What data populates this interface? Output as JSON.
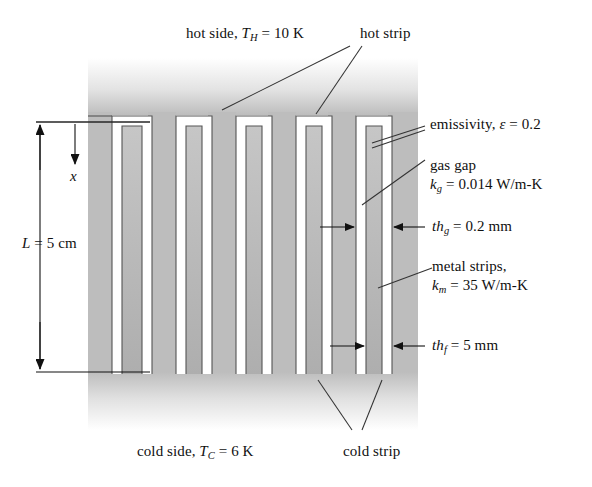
{
  "figure": {
    "type": "engineering-cross-section"
  },
  "labels": {
    "hot_side": {
      "text_pre": "hot side, ",
      "sym": "T",
      "sub": "H",
      "text_post": " = 10 K",
      "full": "hot side, TH = 10 K"
    },
    "hot_strip": {
      "full": "hot strip"
    },
    "emissivity": {
      "text_pre": "emissivity, ",
      "sym": "ε",
      "text_post": " = 0.2",
      "full": "emissivity, ε = 0.2"
    },
    "gas_gap_line1": {
      "full": "gas gap"
    },
    "gas_gap_line2": {
      "sym": "k",
      "sub": "g",
      "text_post": " = 0.014 W/m-K",
      "full": "kg = 0.014 W/m-K"
    },
    "th_g": {
      "sym": "th",
      "sub": "g",
      "text_post": " = 0.2 mm",
      "full": "thg = 0.2 mm"
    },
    "metal_line1": {
      "full": "metal strips,"
    },
    "metal_line2": {
      "sym": "k",
      "sub": "m",
      "text_post": " = 35 W/m-K",
      "full": "km = 35 W/m-K"
    },
    "th_f": {
      "sym": "th",
      "sub": "f",
      "text_post": " = 5 mm",
      "full": "thf = 5 mm"
    },
    "length": {
      "sym": "L",
      "text_post": " = 5 cm",
      "full": "L = 5 cm"
    },
    "coordinate_x": {
      "full": "x"
    },
    "cold_side": {
      "text_pre": "cold side, ",
      "sym": "T",
      "sub": "C",
      "text_post": " = 6 K",
      "full": "cold side, TC = 6 K"
    },
    "cold_strip": {
      "full": "cold strip"
    }
  },
  "values": {
    "T_hot_K": 10,
    "T_cold_K": 6,
    "emissivity": 0.2,
    "k_gas_W_mK": 0.014,
    "k_metal_W_mK": 35,
    "th_gas_mm": 0.2,
    "th_fin_mm": 5,
    "L_cm": 5
  },
  "colors": {
    "metal_gray": "#b0b0b0",
    "block_gray": "#bdbdbd",
    "outline": "#4a4a4a",
    "text": "#101010",
    "background": "#ffffff"
  }
}
